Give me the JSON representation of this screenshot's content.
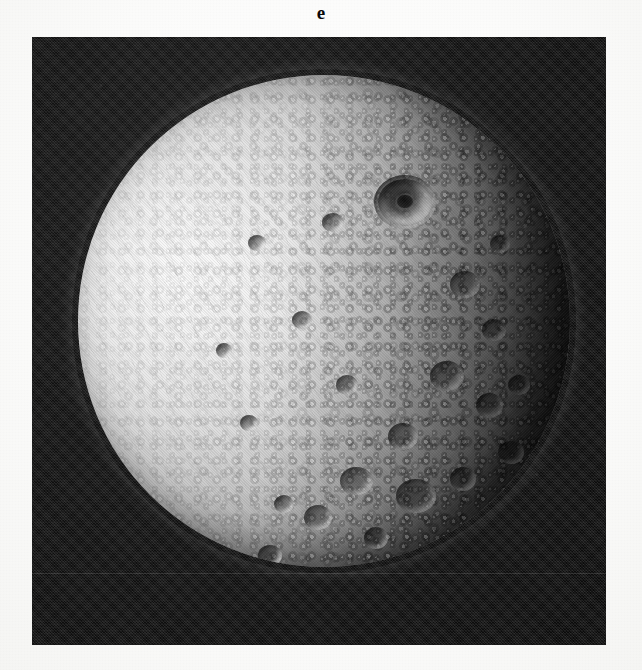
{
  "figure": {
    "panel_label": "e",
    "caption": "",
    "page_background": "#fdfdfd"
  },
  "photograph": {
    "name": "spacecraft-image-of-cratered-icy-moon",
    "frame": {
      "x": 32,
      "y": 37,
      "width": 574,
      "height": 608,
      "background_color": "#0d0d0d"
    },
    "subject": {
      "type": "moon-disk",
      "description": "heavily cratered icy satellite, illuminated from the left, terminator at right limb",
      "center_x": 324,
      "center_y": 321,
      "diameter": 492,
      "highlight_color": "#fbfbfb",
      "midtone_color": "#a8a8a8",
      "shadow_color": "#1d1d1d"
    },
    "features": [
      {
        "name": "large-ringed-crater-with-central-peak",
        "x": 346,
        "y": 127,
        "width": 54,
        "height": 46
      },
      {
        "name": "crater-cluster-southeast",
        "x": 300,
        "y": 420,
        "width": 180,
        "height": 140
      },
      {
        "name": "groove-terrain-west",
        "x": 100,
        "y": 280,
        "width": 150,
        "height": 150
      }
    ],
    "artifacts": [
      {
        "name": "horizontal-scanline",
        "y": 536,
        "opacity": 0.1
      }
    ]
  }
}
